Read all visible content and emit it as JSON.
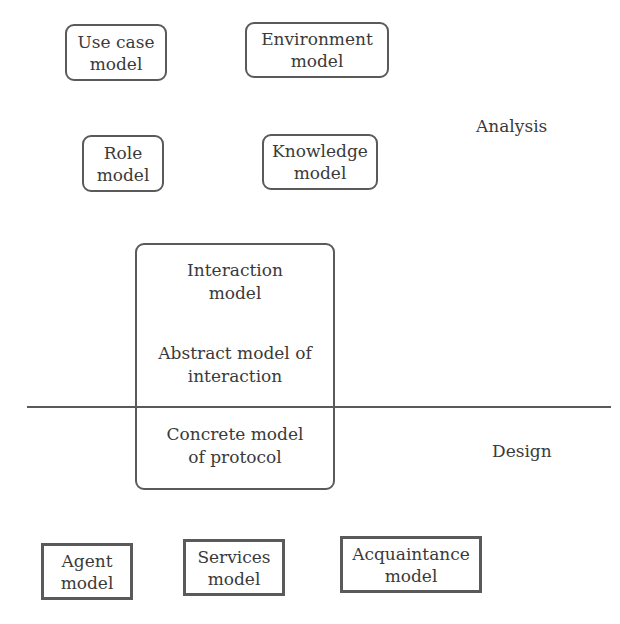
{
  "diagram": {
    "phases": {
      "analysis": "Analysis",
      "design": "Design"
    },
    "analysis_models": {
      "use_case": {
        "line1": "Use case",
        "line2": "model"
      },
      "environment": {
        "line1": "Environment",
        "line2": "model"
      },
      "role": {
        "line1": "Role",
        "line2": "model"
      },
      "knowledge": {
        "line1": "Knowledge",
        "line2": "model"
      }
    },
    "interaction": {
      "title_line1": "Interaction",
      "title_line2": "model",
      "abstract_line1": "Abstract model of",
      "abstract_line2": "interaction",
      "concrete_line1": "Concrete model",
      "concrete_line2": "of protocol"
    },
    "design_models": {
      "agent": {
        "line1": "Agent",
        "line2": "model"
      },
      "services": {
        "line1": "Services",
        "line2": "model"
      },
      "acquaintance": {
        "line1": "Acquaintance",
        "line2": "model"
      }
    },
    "colors": {
      "stroke": "#5a5a5a",
      "text": "#3a3a3a",
      "background": "#ffffff"
    }
  }
}
